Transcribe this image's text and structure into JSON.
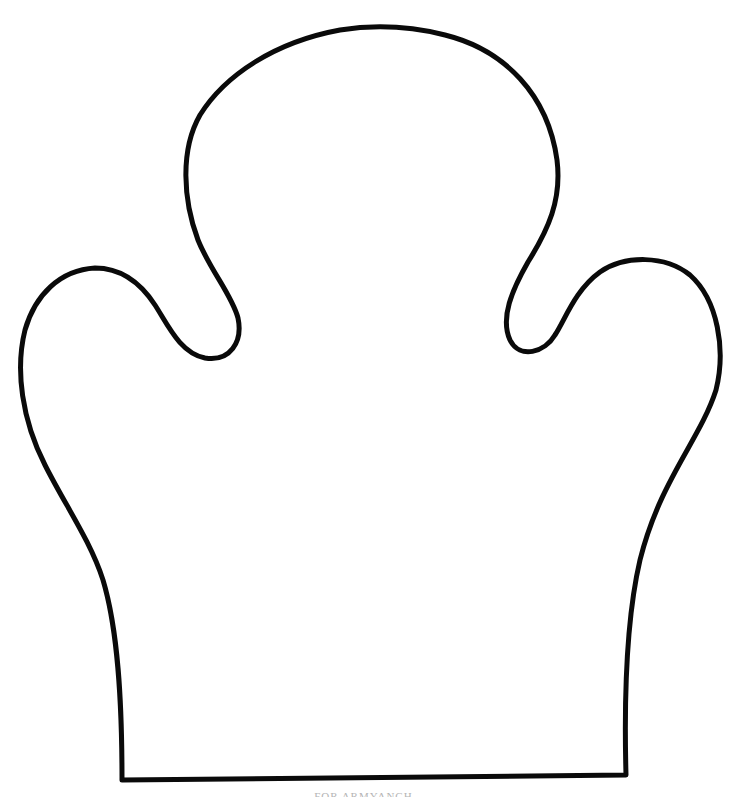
{
  "figure": {
    "stroke_color": "#0a0a0a",
    "fill_color": "#ffffff",
    "background_color": "#ffffff"
  },
  "caption": {
    "text": "FOR ARMYANCH...",
    "color": "#b5b5b5",
    "clipped": true
  }
}
